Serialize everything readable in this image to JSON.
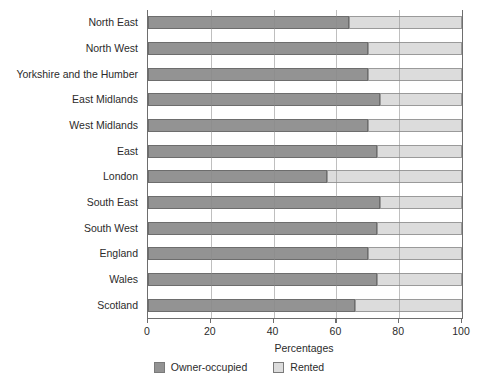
{
  "chart_data": {
    "type": "bar",
    "orientation": "horizontal",
    "stacked": true,
    "title": "",
    "xlabel": "Percentages",
    "ylabel": "",
    "xlim": [
      0,
      100
    ],
    "xticks": [
      0,
      20,
      40,
      60,
      80,
      100
    ],
    "grid": "vertical",
    "legend_position": "bottom",
    "categories": [
      "North East",
      "North West",
      "Yorkshire and the Humber",
      "East Midlands",
      "West Midlands",
      "East",
      "London",
      "South East",
      "South West",
      "England",
      "Wales",
      "Scotland"
    ],
    "series": [
      {
        "name": "Owner-occupied",
        "color": "#939393",
        "values": [
          64,
          70,
          70,
          74,
          70,
          73,
          57,
          74,
          73,
          70,
          73,
          66
        ]
      },
      {
        "name": "Rented",
        "color": "#dcdcdc",
        "values": [
          36,
          30,
          30,
          26,
          30,
          27,
          43,
          26,
          27,
          30,
          27,
          34
        ]
      }
    ]
  },
  "axis": {
    "tick_labels": [
      "0",
      "20",
      "40",
      "60",
      "80",
      "100"
    ],
    "x_title": "Percentages"
  },
  "legend": {
    "items": [
      {
        "label": "Owner-occupied",
        "color": "#939393"
      },
      {
        "label": "Rented",
        "color": "#dcdcdc"
      }
    ]
  }
}
